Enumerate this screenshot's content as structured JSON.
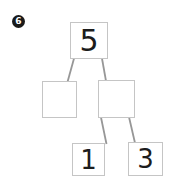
{
  "page": {
    "background_color": "#ffffff"
  },
  "problem_badge": {
    "number": "6",
    "fill_color": "#1a1a1a",
    "text_color": "#ffffff"
  },
  "number_bond": {
    "type": "number-bond-tree",
    "box_border_color": "#c5c5c5",
    "connector_color": "#979797",
    "digit_color": "#1c1c1c",
    "nodes": {
      "root": {
        "value": "5"
      },
      "left_child": {
        "value": ""
      },
      "right_child": {
        "value": ""
      },
      "right_grandchild_left": {
        "value": "1"
      },
      "right_grandchild_right": {
        "value": "3"
      }
    },
    "edges": [
      {
        "from": "root",
        "to": "left_child"
      },
      {
        "from": "root",
        "to": "right_child"
      },
      {
        "from": "right_child",
        "to": "right_grandchild_left"
      },
      {
        "from": "right_child",
        "to": "right_grandchild_right"
      }
    ]
  }
}
